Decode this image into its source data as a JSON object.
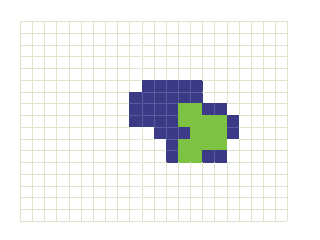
{
  "figure": {
    "grid": {
      "columns": 22,
      "rows": 17,
      "line_color": "#dde6cc",
      "background": "#ffffff"
    },
    "colors": {
      "blue": "#3b3a86",
      "green": "#7dc242"
    },
    "cells": [
      {
        "row": 5,
        "cols": [
          10,
          11,
          12,
          13,
          14
        ],
        "color": "blue"
      },
      {
        "row": 6,
        "cols": [
          9,
          10,
          11,
          12,
          13,
          14
        ],
        "color": "blue"
      },
      {
        "row": 7,
        "cols": [
          9,
          10,
          11,
          12
        ],
        "color": "blue"
      },
      {
        "row": 7,
        "cols": [
          13,
          14
        ],
        "color": "green"
      },
      {
        "row": 7,
        "cols": [
          15,
          16
        ],
        "color": "blue"
      },
      {
        "row": 8,
        "cols": [
          9,
          10,
          11,
          12
        ],
        "color": "blue"
      },
      {
        "row": 8,
        "cols": [
          13,
          14,
          15,
          16
        ],
        "color": "green"
      },
      {
        "row": 8,
        "cols": [
          17
        ],
        "color": "blue"
      },
      {
        "row": 9,
        "cols": [
          11,
          12,
          13
        ],
        "color": "blue"
      },
      {
        "row": 9,
        "cols": [
          14,
          15,
          16
        ],
        "color": "green"
      },
      {
        "row": 9,
        "cols": [
          17
        ],
        "color": "blue"
      },
      {
        "row": 10,
        "cols": [
          12
        ],
        "color": "blue"
      },
      {
        "row": 10,
        "cols": [
          13,
          14,
          15,
          16
        ],
        "color": "green"
      },
      {
        "row": 11,
        "cols": [
          12
        ],
        "color": "blue"
      },
      {
        "row": 11,
        "cols": [
          13,
          14
        ],
        "color": "green"
      },
      {
        "row": 11,
        "cols": [
          15,
          16
        ],
        "color": "blue"
      }
    ]
  }
}
